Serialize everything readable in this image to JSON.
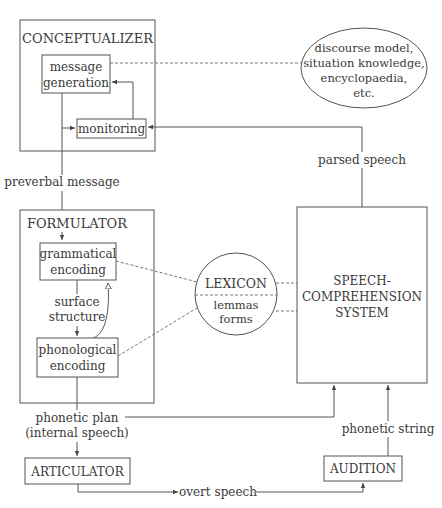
{
  "diagram": {
    "type": "flowchart",
    "title": "",
    "nodes": {
      "conceptualizer": {
        "label": "CONCEPTUALIZER"
      },
      "message_generation": {
        "line1": "message",
        "line2": "generation"
      },
      "monitoring": {
        "label": "monitoring"
      },
      "knowledge": {
        "line1": "discourse model,",
        "line2": "situation knowledge,",
        "line3": "encyclopaedia,",
        "line4": "etc."
      },
      "formulator": {
        "label": "FORMULATOR"
      },
      "grammatical_encoding": {
        "line1": "grammatical",
        "line2": "encoding"
      },
      "phonological_encoding": {
        "line1": "phonological",
        "line2": "encoding"
      },
      "lexicon": {
        "label": "LEXICON",
        "line1": "lemmas",
        "line2": "forms"
      },
      "speech_comprehension": {
        "line1": "SPEECH-",
        "line2": "COMPREHENSION",
        "line3": "SYSTEM"
      },
      "articulator": {
        "label": "ARTICULATOR"
      },
      "audition": {
        "label": "AUDITION"
      }
    },
    "edges": {
      "preverbal_message": "preverbal message",
      "parsed_speech": "parsed speech",
      "surface_structure_1": "surface",
      "surface_structure_2": "structure",
      "phonetic_plan_1": "phonetic plan",
      "phonetic_plan_2": "(internal speech)",
      "phonetic_string": "phonetic string",
      "overt_speech": "overt speech"
    },
    "colors": {
      "stroke": "#555555",
      "text": "#3a3a3a",
      "background": "#ffffff"
    }
  }
}
